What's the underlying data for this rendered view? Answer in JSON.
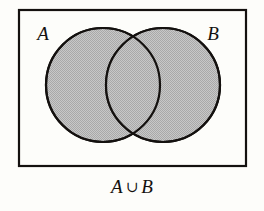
{
  "figure": {
    "type": "venn-diagram",
    "operation": "union"
  },
  "universe": {
    "name": "universal-set-rectangle",
    "x": 19,
    "y": 10,
    "width": 227,
    "height": 156,
    "stroke_color": "#14110f",
    "fill_color": "none",
    "stroke_width": 2.2
  },
  "sets": [
    {
      "id": "set-a",
      "label": "A",
      "cx": 103,
      "cy": 85,
      "r": 57,
      "shaded": true,
      "fill_color": "#bdbdbd",
      "stroke_color": "#14110f",
      "label_x": 43,
      "label_y": 40
    },
    {
      "id": "set-b",
      "label": "B",
      "cx": 163,
      "cy": 85,
      "r": 57,
      "shaded": true,
      "fill_color": "#bdbdbd",
      "stroke_color": "#14110f",
      "label_x": 213,
      "label_y": 40
    }
  ],
  "intersection": {
    "id": "set-a-intersect-b",
    "shaded": true,
    "fill_color": "#bdbdbd"
  },
  "caption": {
    "left_set": "A",
    "operator": "∪",
    "right_set": "B",
    "full_text": "A ∪ B"
  },
  "colors": {
    "background": "#fdfdfa",
    "ink": "#14110f",
    "shade": "#bdbdbd"
  }
}
